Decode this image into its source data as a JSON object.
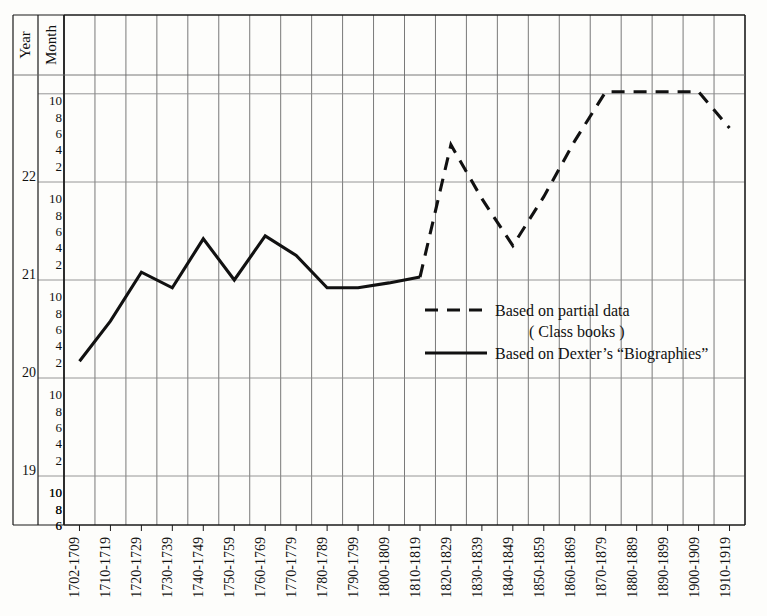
{
  "chart_data": {
    "type": "line",
    "title": "",
    "subtitle": "",
    "xlabel": "",
    "ylabel": "",
    "grid": true,
    "legend_position": "center-right",
    "axis_headers": {
      "year": "Year",
      "month": "Month"
    },
    "y_axis": {
      "unit": "years and months of age",
      "year_ticks": [
        "22",
        "21",
        "20",
        "19"
      ],
      "month_ticks": [
        "10",
        "8",
        "6",
        "4",
        "2"
      ],
      "top_partial_months": [
        "10",
        "8",
        "6",
        "4",
        "2"
      ],
      "bottom_partial_months": [
        "10",
        "8",
        "6"
      ],
      "ylim_years": [
        18.5,
        22.9
      ]
    },
    "categories": [
      "1702-1709",
      "1710-1719",
      "1720-1729",
      "1730-1739",
      "1740-1749",
      "1750-1759",
      "1760-1769",
      "1770-1779",
      "1780-1789",
      "1790-1799",
      "1800-1809",
      "1810-1819",
      "1820-1829",
      "1830-1839",
      "1840-1849",
      "1850-1859",
      "1860-1869",
      "1870-1879",
      "1880-1889",
      "1890-1899",
      "1900-1909",
      "1910-1919"
    ],
    "series": [
      {
        "name": "Based on Dexter's “Biographies”",
        "style": "solid",
        "color": "#111111",
        "categories": [
          "1702-1709",
          "1710-1719",
          "1720-1729",
          "1730-1739",
          "1740-1749",
          "1750-1759",
          "1760-1769",
          "1770-1779",
          "1780-1789",
          "1790-1799",
          "1800-1809",
          "1810-1819"
        ],
        "values_years": [
          20.17,
          20.58,
          21.08,
          20.92,
          21.42,
          21.0,
          21.45,
          21.25,
          20.92,
          20.92,
          20.97,
          21.03
        ],
        "values_labels": [
          "20-2",
          "20-7",
          "21-1",
          "20-11",
          "21-5",
          "21-0",
          "21-5",
          "21-3",
          "20-11",
          "20-11",
          "20-11",
          "21-0"
        ]
      },
      {
        "name": "Based on partial data (Class books)",
        "style": "dashed",
        "color": "#111111",
        "categories": [
          "1810-1819",
          "1820-1829",
          "1830-1839",
          "1840-1849",
          "1850-1859",
          "1860-1869",
          "1870-1879",
          "1880-1889",
          "1890-1899",
          "1900-1909",
          "1910-1919"
        ],
        "values_years": [
          21.03,
          22.38,
          21.83,
          21.35,
          21.85,
          22.42,
          22.92,
          22.92,
          22.92,
          22.92,
          22.55
        ],
        "values_labels": [
          "21-0",
          "22-4",
          "21-10",
          "21-4",
          "21-10",
          "22-5",
          "22-11",
          "22-11",
          "22-11",
          "22-11",
          "22-6"
        ]
      }
    ]
  },
  "legend": {
    "entries": [
      {
        "label_line1": "Based on  partial  data",
        "label_line2": "( Class  books )",
        "style": "dashed"
      },
      {
        "label_line1": "Based on  Dexter’s  “Biographies”",
        "label_line2": "",
        "style": "solid"
      }
    ]
  }
}
